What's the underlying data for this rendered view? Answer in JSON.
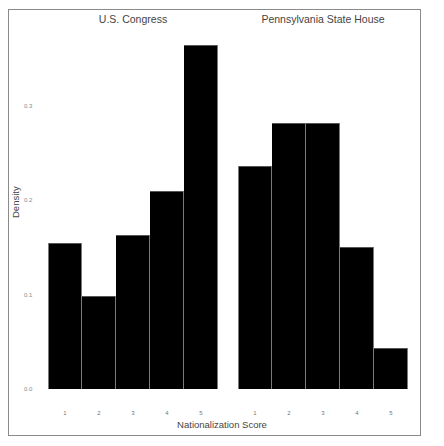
{
  "chart_data": {
    "type": "bar",
    "subtype": "faceted histogram",
    "ylabel": "Density",
    "xlabel": "Nationalization Score",
    "ylim": [
      0,
      0.39
    ],
    "yticks": [
      "0.0",
      "0.1",
      "0.2",
      "0.3"
    ],
    "grid": false,
    "legend": null,
    "categories": [
      "1",
      "2",
      "3",
      "4",
      "5"
    ],
    "panels": [
      {
        "title": "U.S. Congress",
        "values": [
          0.155,
          0.099,
          0.163,
          0.21,
          0.365
        ]
      },
      {
        "title": "Pennsylvania State House",
        "values": [
          0.237,
          0.282,
          0.282,
          0.151,
          0.044
        ]
      }
    ],
    "colors": {
      "bar": "#000000",
      "bar_edge": "#7a7a7a",
      "frame": "#8a8a8a",
      "text": "#444444"
    }
  }
}
